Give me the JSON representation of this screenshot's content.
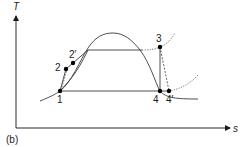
{
  "figure": {
    "panel_label": "(b)",
    "axes": {
      "y_label": "T",
      "x_label": "s"
    },
    "points": [
      {
        "id": "1",
        "label": "1"
      },
      {
        "id": "2",
        "label": "2"
      },
      {
        "id": "2p",
        "label": "2′"
      },
      {
        "id": "3",
        "label": "3"
      },
      {
        "id": "4",
        "label": "4"
      },
      {
        "id": "4p",
        "label": "4′"
      }
    ],
    "colors": {
      "line": "#3a3a3a",
      "point": "#000000",
      "background": "#ffffff"
    }
  }
}
